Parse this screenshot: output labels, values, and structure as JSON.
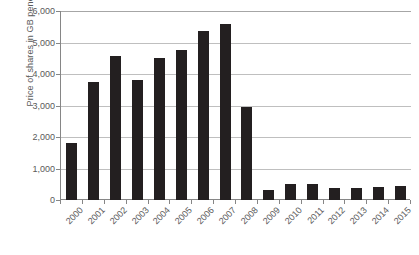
{
  "chart_data": {
    "type": "bar",
    "title": "",
    "xlabel": "",
    "ylabel": "Price of shares in GB pence",
    "categories": [
      "2000",
      "2001",
      "2002",
      "2003",
      "2004",
      "2005",
      "2006",
      "2007",
      "2008",
      "2009",
      "2010",
      "2011",
      "2012",
      "2013",
      "2014",
      "2015"
    ],
    "values": [
      1800,
      3750,
      4580,
      3800,
      4500,
      4770,
      5380,
      5580,
      2950,
      320,
      500,
      510,
      370,
      390,
      400,
      430
    ],
    "ylim": [
      0,
      6000
    ],
    "ytick_values": [
      0,
      1000,
      2000,
      3000,
      4000,
      5000,
      6000
    ],
    "ytick_labels": [
      "0",
      "1,000",
      "2,000",
      "3,000",
      "4,000",
      "5,000",
      "6,000"
    ],
    "grid": true,
    "legend": null,
    "legend_position": "none",
    "bar_color": "#231f20",
    "gridline_color": "#bfbfbf",
    "axis_color": "#868686",
    "text_color": "#5a5a5a",
    "xtick_rotation": -45
  }
}
